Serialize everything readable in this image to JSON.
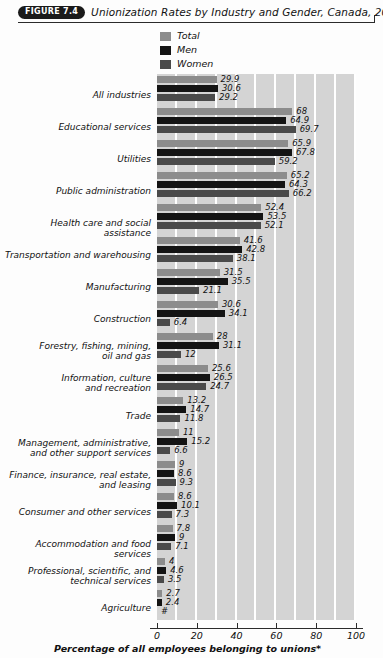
{
  "figure": {
    "badge": "FIGURE 7.4",
    "title": "Unionization Rates by Industry and Gender, Canada, 2000"
  },
  "legend": {
    "position": "top-center",
    "items": [
      {
        "label": "Total",
        "color": "#8c8c8c"
      },
      {
        "label": "Men",
        "color": "#141414"
      },
      {
        "label": "Women",
        "color": "#4a4a4a"
      }
    ]
  },
  "axis": {
    "title": "Percentage of all employees belonging to unions*",
    "ticks": [
      "0",
      "20",
      "40",
      "60",
      "80",
      "100"
    ]
  },
  "chart_data": {
    "type": "bar",
    "orientation": "horizontal",
    "title": "Unionization Rates by Industry and Gender, Canada, 2000",
    "xlabel": "Percentage of all employees belonging to unions*",
    "ylabel": "",
    "xlim": [
      0,
      100
    ],
    "xticks": [
      0,
      20,
      40,
      60,
      80,
      100
    ],
    "grid": true,
    "legend_position": "top-center",
    "colors": {
      "Total": "#8c8c8c",
      "Men": "#141414",
      "Women": "#4a4a4a"
    },
    "categories": [
      "All industries",
      "Educational services",
      "Utilities",
      "Public administration",
      "Health care and social assistance",
      "Transportation and warehousing",
      "Manufacturing",
      "Construction",
      "Forestry, fishing, mining, oil and gas",
      "Information, culture and recreation",
      "Trade",
      "Management, administrative, and other support services",
      "Finance, insurance, real estate, and leasing",
      "Consumer and other services",
      "Accommodation and food services",
      "Professional, scientific, and technical services",
      "Agriculture"
    ],
    "series": [
      {
        "name": "Total",
        "values": [
          29.9,
          68,
          65.9,
          65.2,
          52.4,
          41.6,
          31.5,
          30.6,
          28,
          25.6,
          13.2,
          11,
          9,
          8.6,
          7.8,
          4,
          2.7
        ],
        "labels": [
          "29.9",
          "68",
          "65.9",
          "65.2",
          "52.4",
          "41.6",
          "31.5",
          "30.6",
          "28",
          "25.6",
          "13.2",
          "11",
          "9",
          "8.6",
          "7.8",
          "4",
          "2.7"
        ]
      },
      {
        "name": "Men",
        "values": [
          30.6,
          64.9,
          67.8,
          64.3,
          53.5,
          42.8,
          35.5,
          34.1,
          31.1,
          26.5,
          14.7,
          15.2,
          8.6,
          10.1,
          9,
          4.6,
          2.4
        ],
        "labels": [
          "30.6",
          "64.9",
          "67.8",
          "64.3",
          "53.5",
          "42.8",
          "35.5",
          "34.1",
          "31.1",
          "26.5",
          "14.7",
          "15.2",
          "8.6",
          "10.1",
          "9",
          "4.6",
          "2.4"
        ]
      },
      {
        "name": "Women",
        "values": [
          29.2,
          69.7,
          59.2,
          66.2,
          52.1,
          38.1,
          21.1,
          6.4,
          12,
          24.7,
          11.8,
          6.6,
          9.3,
          7.3,
          7.1,
          3.5,
          0
        ],
        "labels": [
          "29.2",
          "69.7",
          "59.2",
          "66.2",
          "52.1",
          "38.1",
          "21.1",
          "6.4",
          "12",
          "24.7",
          "11.8",
          "6.6",
          "9.3",
          "7.3",
          "7.1",
          "3.5",
          "#"
        ]
      }
    ]
  },
  "rows": [
    {
      "label_lines": [
        "All industries"
      ]
    },
    {
      "label_lines": [
        "Educational services"
      ]
    },
    {
      "label_lines": [
        "Utilities"
      ]
    },
    {
      "label_lines": [
        "Public administration"
      ]
    },
    {
      "label_lines": [
        "Health care and social assistance"
      ]
    },
    {
      "label_lines": [
        "Transportation and warehousing"
      ]
    },
    {
      "label_lines": [
        "Manufacturing"
      ]
    },
    {
      "label_lines": [
        "Construction"
      ]
    },
    {
      "label_lines": [
        "Forestry, fishing, mining,",
        "oil and gas"
      ]
    },
    {
      "label_lines": [
        "Information, culture",
        "and recreation"
      ]
    },
    {
      "label_lines": [
        "Trade"
      ]
    },
    {
      "label_lines": [
        "Management, administrative,",
        "and other support services"
      ]
    },
    {
      "label_lines": [
        "Finance, insurance, real estate,",
        "and leasing"
      ]
    },
    {
      "label_lines": [
        "Consumer and other services"
      ]
    },
    {
      "label_lines": [
        "Accommodation and food services"
      ]
    },
    {
      "label_lines": [
        "Professional, scientific, and",
        "technical services"
      ]
    },
    {
      "label_lines": [
        "Agriculture"
      ]
    }
  ]
}
